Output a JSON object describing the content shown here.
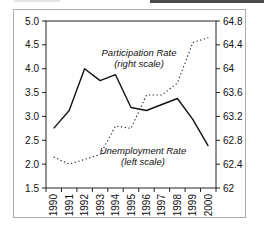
{
  "window": {
    "top_right_edge_fragment_color": "#4a4a4a",
    "top_left_edge_fragment_color": "#e5e5e5"
  },
  "chart_data": {
    "type": "line",
    "title": "",
    "categories": [
      "1990",
      "1991",
      "1992",
      "1993",
      "1994",
      "1995",
      "1996",
      "1997",
      "1998",
      "1999",
      "2000"
    ],
    "series": [
      {
        "name": "Participation Rate",
        "scale": "right",
        "line_style": "solid",
        "color": "#111111",
        "values": [
          63.0,
          63.3,
          64.0,
          63.8,
          63.9,
          63.35,
          63.3,
          63.4,
          63.5,
          63.15,
          62.7
        ]
      },
      {
        "name": "Unemployment Rate",
        "scale": "left",
        "line_style": "dotted",
        "color": "#111111",
        "values": [
          2.15,
          2.0,
          2.1,
          2.2,
          2.8,
          2.75,
          3.45,
          3.45,
          3.7,
          4.55,
          4.65
        ]
      }
    ],
    "left_axis": {
      "range": [
        1.5,
        5.0
      ],
      "tick_labels": [
        "5.0",
        "4.5",
        "4.0",
        "3.5",
        "3.0",
        "2.5",
        "2.0",
        "1.5"
      ]
    },
    "right_axis": {
      "range": [
        62,
        64.8
      ],
      "tick_labels": [
        "64.8",
        "64.4",
        "64",
        "63.6",
        "63.2",
        "62.8",
        "62.4",
        "62"
      ]
    },
    "grid": "off",
    "legend": "none",
    "annotations": [
      {
        "lines": [
          "Participation Rate",
          "(right scale)"
        ]
      },
      {
        "lines": [
          "Unemployment Rate",
          "(left scale)"
        ]
      }
    ]
  }
}
